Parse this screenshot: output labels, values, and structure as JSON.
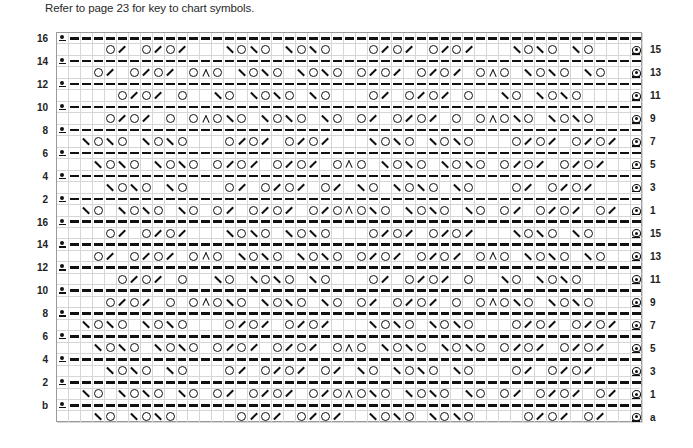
{
  "caption": "Refer to page 23 for key to chart symbols.",
  "chart_data": {
    "type": "table",
    "columns": 49,
    "symbol_legend": {
      ".": "blank (knit)",
      "-": "purl-dash",
      "O": "yarn-over",
      "R": "right-slant decrease (k2tog)",
      "L": "left-slant decrease (ssk)",
      "A": "centered double decrease",
      "*": "dot-underline edge stitch",
      "@": "bobble edge stitch"
    },
    "rows": [
      {
        "label": "16",
        "side": "left",
        "cells": "*------------------------------------------------"
      },
      {
        "label": "15",
        "side": "right",
        "cells": "....OR.OROR...LOLO.LOLO...OROR.OROR...LOLO.LO...@"
      },
      {
        "label": "14",
        "side": "left",
        "cells": "*------------------------------------------------"
      },
      {
        "label": "13",
        "side": "right",
        "cells": "...OR.OROR.OAO.LOLO.LOLO.OROR.OROR.OAO.LOLO.LO..@"
      },
      {
        "label": "12",
        "side": "left",
        "cells": "*------------------------------------------------"
      },
      {
        "label": "11",
        "side": "right",
        "cells": ".....OROR.O..LO.LOLO.LO...OR.OROR.O..LO.LOLO....@"
      },
      {
        "label": "10",
        "side": "left",
        "cells": "*------------------------------------------------"
      },
      {
        "label": "9",
        "side": "right",
        "cells": "....OROR.O.OAOLO.LOLO.LO.OR.OROR.O.OAOLO.LOLO...@"
      },
      {
        "label": "8",
        "side": "left",
        "cells": "*------------------------------------------------"
      },
      {
        "label": "7",
        "side": "right",
        "cells": "..LOLO.LOLO...OROR.OROR...LOLO.LOLO...OROR.OROR.@"
      },
      {
        "label": "6",
        "side": "left",
        "cells": "*------------------------------------------------"
      },
      {
        "label": "5",
        "side": "right",
        "cells": "...LOLO.LOLO.OROR.OROR.OAO.LOLO.LOLO.OROR.OROR..@"
      },
      {
        "label": "4",
        "side": "left",
        "cells": "*------------------------------------------------"
      },
      {
        "label": "3",
        "side": "right",
        "cells": "....LOLO.LO...OR.OROR.OR.LO.LOLO.LO...OR.OROR...@"
      },
      {
        "label": "2",
        "side": "left",
        "cells": "*------------------------------------------------"
      },
      {
        "label": "1",
        "side": "right",
        "cells": "..LO.LOLO.LO.OR.OROR.OROAOLO.LOLO.LO.OR.OROR.OR.@"
      },
      {
        "label": "16",
        "side": "left",
        "cells": "*------------------------------------------------"
      },
      {
        "label": "15",
        "side": "right",
        "cells": "....OR.OROR...LOLO.LOLO...OROR.OROR...LOLO.LO...@"
      },
      {
        "label": "14",
        "side": "left",
        "cells": "*------------------------------------------------"
      },
      {
        "label": "13",
        "side": "right",
        "cells": "...OR.OROR.OAO.LOLO.LOLO.OROR.OROR.OAO.LOLO.LO..@"
      },
      {
        "label": "12",
        "side": "left",
        "cells": "*------------------------------------------------"
      },
      {
        "label": "11",
        "side": "right",
        "cells": ".....OROR.O..LO.LOLO.LO...OR.OROR.O..LO.LOLO....@"
      },
      {
        "label": "10",
        "side": "left",
        "cells": "*------------------------------------------------"
      },
      {
        "label": "9",
        "side": "right",
        "cells": "....OROR.O.OAOLO.LOLO.LO.OR.OROR.O.OAOLO.LOLO...@"
      },
      {
        "label": "8",
        "side": "left",
        "cells": "*------------------------------------------------"
      },
      {
        "label": "7",
        "side": "right",
        "cells": "..LOLO.LOLO...OROR.OROR...LOLO.LOLO...OROR.OROR.@"
      },
      {
        "label": "6",
        "side": "left",
        "cells": "*------------------------------------------------"
      },
      {
        "label": "5",
        "side": "right",
        "cells": "...LOLO.LOLO.OROR.OROR.OAO.LOLO.LOLO.OROR.OROR..@"
      },
      {
        "label": "4",
        "side": "left",
        "cells": "*------------------------------------------------"
      },
      {
        "label": "3",
        "side": "right",
        "cells": "....LOLO.LO...OR.OROR.OR.LO.LOLO.LO...OR.OROR...@"
      },
      {
        "label": "2",
        "side": "left",
        "cells": "*------------------------------------------------"
      },
      {
        "label": "1",
        "side": "right",
        "cells": "..LO.LOLO.LO.OR.OROR.OROAOLO.LOLO.LO.OR.OROR.OR.@"
      },
      {
        "label": "b",
        "side": "left",
        "cells": "*------------------------------------------------"
      },
      {
        "label": "a",
        "side": "right",
        "cells": "...LO.LOLO.....OROR.OROR..LOLO.LOLO....OROR.OR..@"
      }
    ]
  }
}
